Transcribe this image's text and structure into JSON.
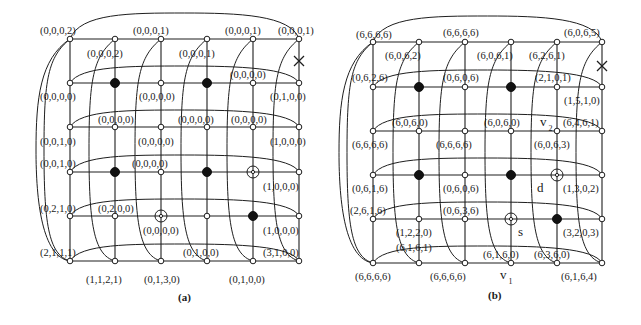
{
  "figure": {
    "panels": [
      {
        "id": "a",
        "caption": "(a)",
        "caption_pos": [
          178,
          301
        ],
        "cols_x": [
          70,
          115,
          161,
          207,
          253,
          299
        ],
        "rows_y": [
          39,
          83,
          127,
          172,
          216,
          261
        ],
        "filled_nodes": [
          [
            1,
            1
          ],
          [
            3,
            1
          ],
          [
            1,
            3
          ],
          [
            3,
            3
          ],
          [
            4,
            4
          ]
        ],
        "open_circle_nodes": [
          [
            4,
            3
          ],
          [
            2,
            4
          ]
        ],
        "fault_x": [
          299,
          61
        ],
        "labels": [
          {
            "text": "(0,0,0,2)",
            "x": 40,
            "y": 34
          },
          {
            "text": "(0,0,0,1)",
            "x": 133,
            "y": 34
          },
          {
            "text": "(0,0,0,1)",
            "x": 225,
            "y": 34
          },
          {
            "text": "(0,0,0,1)",
            "x": 278,
            "y": 34
          },
          {
            "text": "(0,0,0,2)",
            "x": 87,
            "y": 57
          },
          {
            "text": "(0,0,0,1)",
            "x": 179,
            "y": 57
          },
          {
            "text": "(0,0,0,0)",
            "x": 230,
            "y": 78
          },
          {
            "text": "(0,0,0,0)",
            "x": 40,
            "y": 100
          },
          {
            "text": "(0,0,0,0)",
            "x": 139,
            "y": 100
          },
          {
            "text": "(0,1,0,0)",
            "x": 270,
            "y": 100
          },
          {
            "text": "(0,0,0,0)",
            "x": 98,
            "y": 123
          },
          {
            "text": "(0,0,0,0)",
            "x": 178,
            "y": 123
          },
          {
            "text": "(0,0,0,0)",
            "x": 231,
            "y": 123
          },
          {
            "text": "(0,0,1,0)",
            "x": 40,
            "y": 145
          },
          {
            "text": "(0,0,0,0)",
            "x": 138,
            "y": 145
          },
          {
            "text": "(1,0,0,0)",
            "x": 270,
            "y": 145
          },
          {
            "text": "(0,0,1,0)",
            "x": 40,
            "y": 167
          },
          {
            "text": "(0,0,0,0)",
            "x": 132,
            "y": 167
          },
          {
            "text": "(1,0,0,0)",
            "x": 263,
            "y": 190
          },
          {
            "text": "(0,2,1,0)",
            "x": 40,
            "y": 212
          },
          {
            "text": "(0,2,0,0)",
            "x": 98,
            "y": 212
          },
          {
            "text": "(0,0,0,0)",
            "x": 143,
            "y": 234
          },
          {
            "text": "(1,0,0,0)",
            "x": 263,
            "y": 234
          },
          {
            "text": "(2,1,1,1)",
            "x": 40,
            "y": 256
          },
          {
            "text": "(0,1,0,0)",
            "x": 183,
            "y": 256
          },
          {
            "text": "(3,1,0,0)",
            "x": 263,
            "y": 256
          },
          {
            "text": "(1,1,2,1)",
            "x": 86,
            "y": 283
          },
          {
            "text": "(0,1,3,0)",
            "x": 144,
            "y": 283
          },
          {
            "text": "(0,1,0,0)",
            "x": 229,
            "y": 283
          }
        ],
        "marks": []
      },
      {
        "id": "b",
        "caption": "(b)",
        "caption_pos": [
          488,
          299
        ],
        "cols_x": [
          373,
          419,
          465,
          511,
          557,
          602
        ],
        "rows_y": [
          42,
          87,
          131,
          175,
          219,
          263
        ],
        "filled_nodes": [
          [
            1,
            1
          ],
          [
            3,
            1
          ],
          [
            1,
            3
          ],
          [
            3,
            3
          ],
          [
            4,
            4
          ]
        ],
        "open_circle_nodes": [
          [
            4,
            3
          ],
          [
            3,
            4
          ]
        ],
        "fault_x": [
          602,
          66
        ],
        "labels": [
          {
            "text": "(6,6,6,6)",
            "x": 356,
            "y": 38
          },
          {
            "text": "(6,6,6,6)",
            "x": 443,
            "y": 36
          },
          {
            "text": "(6,0,6,5)",
            "x": 564,
            "y": 36
          },
          {
            "text": "(6,0,6,2)",
            "x": 385,
            "y": 59
          },
          {
            "text": "(6,0,6,1)",
            "x": 477,
            "y": 59
          },
          {
            "text": "(6,2,6,1)",
            "x": 529,
            "y": 59
          },
          {
            "text": "(0,6,2,6)",
            "x": 352,
            "y": 81
          },
          {
            "text": "(0,6,0,6)",
            "x": 443,
            "y": 81
          },
          {
            "text": "(2,1,0,1)",
            "x": 535,
            "y": 81
          },
          {
            "text": "(1,5,1,0)",
            "x": 564,
            "y": 104
          },
          {
            "text": "(6,0,6,0)",
            "x": 392,
            "y": 126
          },
          {
            "text": "(6,0,6,0)",
            "x": 484,
            "y": 126
          },
          {
            "text": "(6,4,6,1)",
            "x": 563,
            "y": 126
          },
          {
            "text": "(6,6,6,6)",
            "x": 352,
            "y": 148
          },
          {
            "text": "(6,6,6,6)",
            "x": 436,
            "y": 148
          },
          {
            "text": "(6,0,6,3)",
            "x": 534,
            "y": 148
          },
          {
            "text": "(0,6,1,6)",
            "x": 352,
            "y": 192
          },
          {
            "text": "(0,6,0,6)",
            "x": 443,
            "y": 192
          },
          {
            "text": "(1,3,0,2)",
            "x": 563,
            "y": 192
          },
          {
            "text": "(2,6,1,6)",
            "x": 350,
            "y": 214
          },
          {
            "text": "(0,6,3,6)",
            "x": 443,
            "y": 214
          },
          {
            "text": "(1,2,2,0)",
            "x": 396,
            "y": 236
          },
          {
            "text": "(3,2,0,3)",
            "x": 563,
            "y": 236
          },
          {
            "text": "(6,1,6,1)",
            "x": 396,
            "y": 251
          },
          {
            "text": "(6,1,6,0)",
            "x": 483,
            "y": 258
          },
          {
            "text": "(6,3,6,0)",
            "x": 534,
            "y": 258
          },
          {
            "text": "(6,6,6,6)",
            "x": 355,
            "y": 280
          },
          {
            "text": "(6,6,6,6)",
            "x": 430,
            "y": 280
          },
          {
            "text": "(6,1,6,4)",
            "x": 561,
            "y": 280
          }
        ],
        "marks": [
          {
            "text": "v",
            "sub": "2",
            "x": 540,
            "y": 126
          },
          {
            "text": "d",
            "x": 537,
            "y": 192
          },
          {
            "text": "s",
            "x": 518,
            "y": 236
          },
          {
            "text": "v",
            "sub": "1",
            "x": 500,
            "y": 279
          }
        ]
      }
    ]
  }
}
